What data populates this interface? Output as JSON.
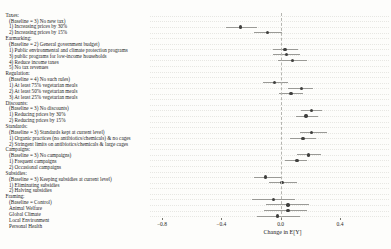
{
  "chart_data": {
    "type": "scatter",
    "subtype": "forest-dot-whisker",
    "title": "",
    "xlabel": "Change in E[Y]",
    "ylabel": "",
    "x_tick_labels": [
      "−0.8",
      "−0.4",
      "0.0",
      "0.4"
    ],
    "x_tick_values": [
      -0.8,
      -0.4,
      0.0,
      0.4
    ],
    "xlim": [
      -0.88,
      0.73
    ],
    "zero_reference_line": 0.0,
    "grid": "dotted horizontal line per row",
    "legend": "none",
    "rows": [
      {
        "label": "Taxes:",
        "kind": "header",
        "estimate": null,
        "ci": null
      },
      {
        "label": "(Baseline = 3) No new tax)",
        "kind": "baseline",
        "estimate": null,
        "ci": null
      },
      {
        "label": "1) Increasing prices by 30%",
        "kind": "item",
        "estimate": -0.27,
        "ci": [
          -0.37,
          -0.16
        ]
      },
      {
        "label": "2) Increasing prices by 15%",
        "kind": "item",
        "estimate": -0.09,
        "ci": [
          -0.18,
          0.01
        ]
      },
      {
        "label": "Earmarking:",
        "kind": "header",
        "estimate": null,
        "ci": null
      },
      {
        "label": "(Baseline = 2) General government budget)",
        "kind": "baseline",
        "estimate": null,
        "ci": null
      },
      {
        "label": "1) Public environmental and climate protection programs",
        "kind": "item",
        "estimate": 0.03,
        "ci": [
          -0.05,
          0.12
        ]
      },
      {
        "label": "3) public programs for low-income households",
        "kind": "item",
        "estimate": 0.04,
        "ci": [
          -0.05,
          0.13
        ]
      },
      {
        "label": "4) Reduce income taxes",
        "kind": "item",
        "estimate": 0.08,
        "ci": [
          -0.02,
          0.18
        ]
      },
      {
        "label": "5) No tax revenues",
        "kind": "item",
        "estimate": null,
        "ci": null
      },
      {
        "label": "Regulation:",
        "kind": "header",
        "estimate": null,
        "ci": null
      },
      {
        "label": "(Baseline = 4) No such rules)",
        "kind": "baseline",
        "estimate": null,
        "ci": null
      },
      {
        "label": "1) At least 75% vegetarian meals",
        "kind": "item",
        "estimate": -0.04,
        "ci": [
          -0.12,
          0.05
        ]
      },
      {
        "label": "2) At least 50% vegetarian meals",
        "kind": "item",
        "estimate": 0.14,
        "ci": [
          0.05,
          0.22
        ]
      },
      {
        "label": "3) At least 25% vegetarian meals",
        "kind": "item",
        "estimate": 0.07,
        "ci": [
          -0.01,
          0.15
        ]
      },
      {
        "label": "Discounts:",
        "kind": "header",
        "estimate": null,
        "ci": null
      },
      {
        "label": "(Baseline = 3) No discounts)",
        "kind": "baseline",
        "estimate": null,
        "ci": null
      },
      {
        "label": "1) Reducing prices by 30%",
        "kind": "item",
        "estimate": 0.21,
        "ci": [
          0.14,
          0.28
        ]
      },
      {
        "label": "2) Reducing prices by 15%",
        "kind": "item",
        "estimate": 0.17,
        "ci": [
          0.1,
          0.25
        ]
      },
      {
        "label": "Standards:",
        "kind": "header",
        "estimate": null,
        "ci": null
      },
      {
        "label": "(Baseline = 3) Standards kept at current level)",
        "kind": "baseline",
        "estimate": null,
        "ci": null
      },
      {
        "label": "1) Organic practices (no antibiotics/chemicals) & no cages",
        "kind": "item",
        "estimate": 0.21,
        "ci": [
          0.13,
          0.31
        ]
      },
      {
        "label": "2) Stringent limits on antibiotics/chemicals & large cages",
        "kind": "item",
        "estimate": 0.15,
        "ci": [
          0.06,
          0.24
        ]
      },
      {
        "label": "Campaigns:",
        "kind": "header",
        "estimate": null,
        "ci": null
      },
      {
        "label": "(Baseline = 3) No campaigns)",
        "kind": "baseline",
        "estimate": null,
        "ci": null
      },
      {
        "label": "1) Frequent campaigns",
        "kind": "item",
        "estimate": 0.19,
        "ci": [
          0.11,
          0.27
        ]
      },
      {
        "label": "2) Occasional campaigns",
        "kind": "item",
        "estimate": 0.11,
        "ci": [
          0.03,
          0.18
        ]
      },
      {
        "label": "Subsidies:",
        "kind": "header",
        "estimate": null,
        "ci": null
      },
      {
        "label": "(Baseline = 3) Keeping subsidies at current level)",
        "kind": "baseline",
        "estimate": null,
        "ci": null
      },
      {
        "label": "1) Eliminating subsidies",
        "kind": "item",
        "estimate": -0.1,
        "ci": [
          -0.18,
          0.01
        ]
      },
      {
        "label": "2) Halving subsidies",
        "kind": "item",
        "estimate": 0.01,
        "ci": [
          -0.08,
          0.11
        ]
      },
      {
        "label": "Framing:",
        "kind": "header",
        "estimate": null,
        "ci": null
      },
      {
        "label": "(Baseline = Control)",
        "kind": "baseline",
        "estimate": null,
        "ci": null
      },
      {
        "label": "Animal Welfare",
        "kind": "item",
        "estimate": -0.05,
        "ci": [
          -0.19,
          0.1
        ]
      },
      {
        "label": "Global Climate",
        "kind": "item",
        "estimate": 0.05,
        "ci": [
          -0.1,
          0.19
        ]
      },
      {
        "label": "Local Environment",
        "kind": "item",
        "estimate": 0.05,
        "ci": [
          -0.11,
          0.18
        ]
      },
      {
        "label": "Personal Health",
        "kind": "item",
        "estimate": -0.02,
        "ci": [
          -0.16,
          0.13
        ]
      }
    ]
  },
  "colors": {
    "background": "#fdfdfb",
    "point": "#3f3f3d",
    "ci_line": "#9a9a96",
    "gridline": "#e7e7e3",
    "zero_line": "#b5b5b0",
    "text": "#1c1c1c"
  }
}
